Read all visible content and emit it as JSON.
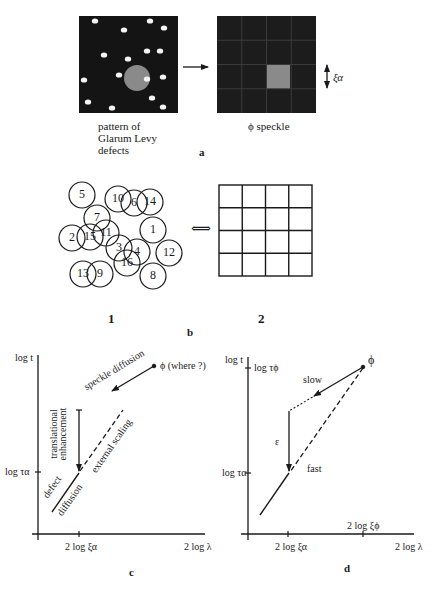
{
  "panel_a": {
    "left_caption_1": "pattern of",
    "left_caption_2": "Glarum Levy",
    "left_caption_3": "defects",
    "right_caption": "ϕ speckle",
    "scale_label": "ξα",
    "panel_label": "a",
    "defects": [
      [
        95,
        21
      ],
      [
        124,
        30
      ],
      [
        150,
        21
      ],
      [
        164,
        28
      ],
      [
        104,
        55
      ],
      [
        128,
        59
      ],
      [
        147,
        51
      ],
      [
        160,
        51
      ],
      [
        84,
        80
      ],
      [
        119,
        75
      ],
      [
        147,
        79
      ],
      [
        163,
        77
      ],
      [
        88,
        102
      ],
      [
        112,
        108
      ],
      [
        152,
        98
      ],
      [
        163,
        107
      ]
    ],
    "highlight_color": "#8a8a8a",
    "box_color": "#141414"
  },
  "panel_b": {
    "circles": [
      {
        "n": "5",
        "x": 82,
        "y": 195
      },
      {
        "n": "10",
        "x": 118,
        "y": 199
      },
      {
        "n": "6",
        "x": 134,
        "y": 203
      },
      {
        "n": "14",
        "x": 150,
        "y": 202
      },
      {
        "n": "7",
        "x": 97,
        "y": 218
      },
      {
        "n": "2",
        "x": 72,
        "y": 238
      },
      {
        "n": "15",
        "x": 90,
        "y": 237
      },
      {
        "n": "11",
        "x": 106,
        "y": 233
      },
      {
        "n": "1",
        "x": 153,
        "y": 230
      },
      {
        "n": "3",
        "x": 119,
        "y": 248
      },
      {
        "n": "4",
        "x": 137,
        "y": 252
      },
      {
        "n": "12",
        "x": 169,
        "y": 253
      },
      {
        "n": "16",
        "x": 127,
        "y": 263
      },
      {
        "n": "13",
        "x": 83,
        "y": 274
      },
      {
        "n": "9",
        "x": 100,
        "y": 274
      },
      {
        "n": "8",
        "x": 153,
        "y": 276
      }
    ],
    "arrow_symbol": "⟺",
    "label_1": "1",
    "label_2": "2",
    "panel_label": "b"
  },
  "panel_c": {
    "y_axis_top": "log t",
    "y_tick": "log τα",
    "x_tick": "2 log ξα",
    "x_axis_end": "2 log λ",
    "phi_label": "ϕ (where ?)",
    "speckle_diffusion": "speckle diffusion",
    "translational_1": "translational",
    "translational_2": "enhancement",
    "external_scaling": "external scaling",
    "defect": "defect",
    "diffusion": "diffusion",
    "panel_label": "c"
  },
  "panel_d": {
    "y_axis_top": "log t",
    "y_tick_top": "log τϕ",
    "y_tick": "log τα",
    "x_tick_1": "2 log ξα",
    "x_tick_2": "2 log ξϕ",
    "x_axis_end": "2 log λ",
    "phi_label": "ϕ",
    "slow": "slow",
    "fast": "fast",
    "epsilon": "ε",
    "panel_label": "d"
  }
}
